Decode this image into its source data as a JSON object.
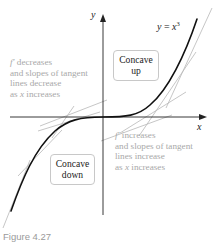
{
  "figure": {
    "caption": "Figure 4.27",
    "equation": {
      "lhs": "y",
      "eq": " = ",
      "base": "x",
      "exponent": "3"
    },
    "axes": {
      "x_label": "x",
      "y_label": "y"
    },
    "regions": {
      "concave_up": {
        "line1": "Concave",
        "line2": "up"
      },
      "concave_down": {
        "line1": "Concave",
        "line2": "down"
      }
    },
    "annotations": {
      "left": {
        "fprime": "f′",
        "line1_rest": " decreases",
        "line2": "and slopes of tangent",
        "line3": "lines decrease",
        "line4_pre": "as ",
        "line4_var": "x",
        "line4_post": " increases"
      },
      "right": {
        "fprime": "f′",
        "line1_rest": " increases",
        "line2": "and slopes of tangent",
        "line3": "lines increase",
        "line4_pre": "as ",
        "line4_var": "x",
        "line4_post": " increases"
      }
    },
    "colors": {
      "curve": "#111111",
      "axes": "#222222",
      "tangent": "#b5b5b5",
      "annotation_text": "#a8a8a8",
      "caption": "#9a9a9a"
    }
  }
}
